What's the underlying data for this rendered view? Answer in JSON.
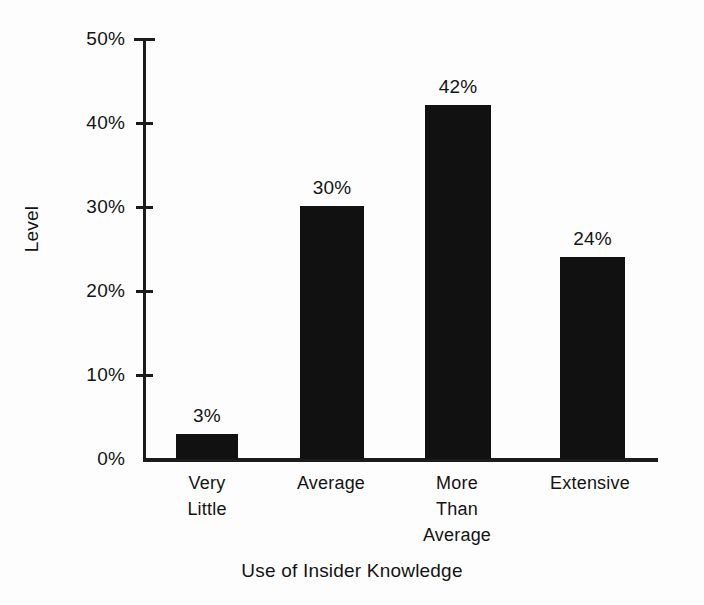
{
  "chart_data": {
    "type": "bar",
    "title": "",
    "xlabel": "Use of Insider Knowledge",
    "ylabel": "Level",
    "categories": [
      "Very\nLittle",
      "Average",
      "More\nThan\nAverage",
      "Extensive"
    ],
    "category_lines": [
      [
        "Very",
        "Little"
      ],
      [
        "Average"
      ],
      [
        "More",
        "Than",
        "Average"
      ],
      [
        "Extensive"
      ]
    ],
    "values": [
      3,
      30,
      42,
      24
    ],
    "value_labels": [
      "3%",
      "30%",
      "42%",
      "24%"
    ],
    "ylim": [
      0,
      50
    ],
    "ytick_values": [
      0,
      10,
      20,
      30,
      40,
      50
    ],
    "ytick_labels": [
      "0%",
      "10%",
      "20%",
      "30%",
      "40%",
      "50%"
    ],
    "grid": false,
    "legend": false,
    "bar_color": "#111111",
    "axis_color": "#1c1c1c",
    "background_color": "#fdfdfd"
  }
}
